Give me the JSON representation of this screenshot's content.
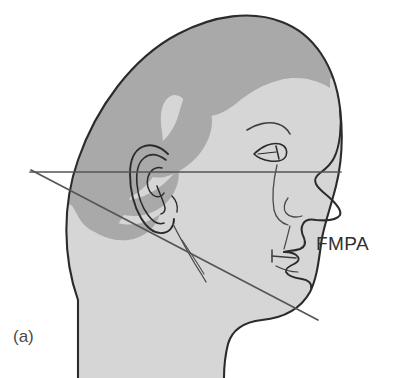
{
  "figure": {
    "panel_label": "(a)",
    "type": "anatomical-line-diagram",
    "annotations": [
      {
        "name": "fmpa-label",
        "text": "FMPA",
        "meaning": "Frankfort-Mandibular Plane Angle"
      }
    ],
    "reference_lines": [
      {
        "name": "frankfort-horizontal-plane",
        "orientation": "horizontal",
        "color": "#555555",
        "x1": 30,
        "y1": 172,
        "x2": 341,
        "y2": 172
      },
      {
        "name": "mandibular-plane",
        "orientation": "diagonal-descending",
        "color": "#555555",
        "x1": 31,
        "y1": 170,
        "x2": 318,
        "y2": 320
      }
    ],
    "colors": {
      "background": "#ffffff",
      "hair_fill": "#a9a9a9",
      "skin_fill": "#d6d6d6",
      "outline": "#2b2b2b",
      "detail_line": "#3d3d3d",
      "reference_line": "#555555",
      "text": "#303030"
    },
    "anatomy_parts": [
      "cranium",
      "hairline",
      "forehead",
      "eyebrow",
      "eye",
      "nose",
      "nasolabial-fold",
      "lips",
      "chin",
      "ear",
      "jawline",
      "neck"
    ]
  }
}
